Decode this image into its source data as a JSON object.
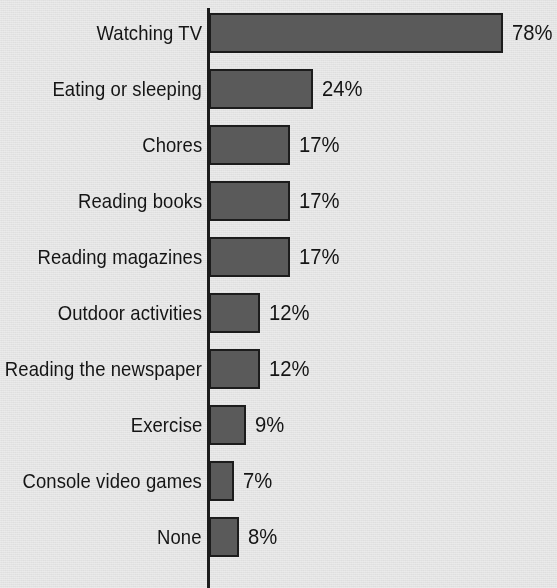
{
  "chart_data": {
    "type": "bar",
    "orientation": "horizontal",
    "title": "",
    "subtitle": "",
    "xlabel": "",
    "ylabel": "",
    "xlim": [
      0,
      78
    ],
    "grid": false,
    "legend": false,
    "value_suffix": "%",
    "categories": [
      "Watching TV",
      "Eating or sleeping",
      "Chores",
      "Reading books",
      "Reading magazines",
      "Outdoor activities",
      "Reading the newspaper",
      "Exercise",
      "Console video games",
      "None"
    ],
    "values": [
      78,
      24,
      17,
      17,
      17,
      12,
      12,
      9,
      7,
      8
    ],
    "value_labels": [
      "78%",
      "24%",
      "17%",
      "17%",
      "17%",
      "12%",
      "12%",
      "9%",
      "7%",
      "8%"
    ],
    "bar_color": "#5a5a5a",
    "bar_border_color": "#1c1c1c",
    "axis_color": "#1d1d1d",
    "background_color": "#ebebeb",
    "text_color": "#151515"
  },
  "rows": [
    {
      "label": "Watching TV",
      "value": 78,
      "value_label": "78%",
      "bar_px": 294,
      "top_px": 13
    },
    {
      "label": "Eating or sleeping",
      "value": 24,
      "value_label": "24%",
      "bar_px": 104,
      "top_px": 69
    },
    {
      "label": "Chores",
      "value": 17,
      "value_label": "17%",
      "bar_px": 81,
      "top_px": 125
    },
    {
      "label": "Reading books",
      "value": 17,
      "value_label": "17%",
      "bar_px": 81,
      "top_px": 181
    },
    {
      "label": "Reading magazines",
      "value": 17,
      "value_label": "17%",
      "bar_px": 81,
      "top_px": 237
    },
    {
      "label": "Outdoor activities",
      "value": 12,
      "value_label": "12%",
      "bar_px": 51,
      "top_px": 293
    },
    {
      "label": "Reading the newspaper",
      "value": 12,
      "value_label": "12%",
      "bar_px": 51,
      "top_px": 349
    },
    {
      "label": "Exercise",
      "value": 9,
      "value_label": "9%",
      "bar_px": 37,
      "top_px": 405
    },
    {
      "label": "Console video games",
      "value": 7,
      "value_label": "7%",
      "bar_px": 25,
      "top_px": 461
    },
    {
      "label": "None",
      "value": 8,
      "value_label": "8%",
      "bar_px": 30,
      "top_px": 517
    }
  ]
}
